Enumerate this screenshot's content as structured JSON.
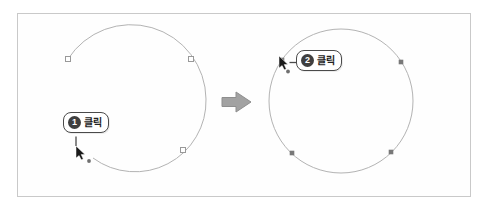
{
  "figure": {
    "kind": "pen-tool tutorial diagram, two states with transition arrow",
    "callouts": [
      {
        "number": "1",
        "label": "클릭"
      },
      {
        "number": "2",
        "label": "클릭"
      }
    ],
    "shapes": {
      "left": {
        "type": "open-circle-path",
        "anchor_style": "hollow-square",
        "anchor_count": 3
      },
      "right": {
        "type": "closed-circle-path",
        "anchor_style": "filled-square",
        "anchor_count": 4
      }
    },
    "colors": {
      "panel_border": "#c9c9c9",
      "path_stroke": "#b3b3b3",
      "anchor_hollow_fill": "#ffffff",
      "anchor_border": "#999999",
      "anchor_filled": "#787878",
      "callout_border": "#4a4a4a",
      "badge_background": "#3f3f3f",
      "badge_text": "#ffffff",
      "label_text": "#222222",
      "cursor": "#1a1a1a",
      "transition_arrow": "#a2a2a2"
    }
  }
}
